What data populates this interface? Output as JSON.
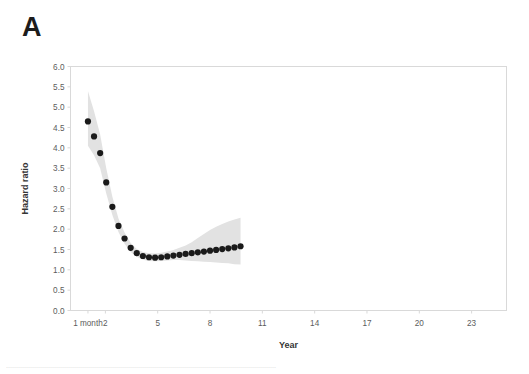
{
  "figure": {
    "panel_label": "A",
    "background_color": "#ffffff"
  },
  "axes": {
    "y_title": "Hazard ratio",
    "x_title": "Year",
    "y_ticks": [
      "0.0",
      "0.5",
      "1.0",
      "1.5",
      "2.0",
      "2.5",
      "3.0",
      "3.5",
      "4.0",
      "4.5",
      "5.0",
      "5.5",
      "6.0"
    ],
    "x_ticks": [
      "1 month",
      "2",
      "5",
      "8",
      "11",
      "14",
      "17",
      "20",
      "23"
    ],
    "frame_color": "#d9d9d9",
    "tick_label_color": "#5c5c5c",
    "axis_title_color": "#353535"
  },
  "caption": {
    "text": "......................................................................................................................................."
  },
  "chart_data": {
    "type": "scatter",
    "title": "",
    "subtitle": "",
    "xlabel": "Year",
    "ylabel": "Hazard ratio",
    "xlim": [
      0,
      25
    ],
    "ylim": [
      0,
      6
    ],
    "grid": false,
    "legend": "none",
    "marker_color": "#1a1a1a",
    "band_color": "#e2e2e2",
    "band_label": "95% confidence interval",
    "x_tick_values": [
      1,
      2,
      5,
      8,
      11,
      14,
      17,
      20,
      23
    ],
    "x_tick_labels": [
      "1 month",
      "2",
      "5",
      "8",
      "11",
      "14",
      "17",
      "20",
      "23"
    ],
    "y_tick_values": [
      0.0,
      0.5,
      1.0,
      1.5,
      2.0,
      2.5,
      3.0,
      3.5,
      4.0,
      4.5,
      5.0,
      5.5,
      6.0
    ],
    "series": [
      {
        "name": "Hazard ratio",
        "x": [
          1.0,
          1.35,
          1.7,
          2.05,
          2.4,
          2.75,
          3.1,
          3.45,
          3.8,
          4.15,
          4.5,
          4.85,
          5.2,
          5.55,
          5.9,
          6.25,
          6.6,
          6.95,
          7.3,
          7.65,
          8.0,
          8.35,
          8.7,
          9.05,
          9.4,
          9.75
        ],
        "x_year_labels": [
          "1 month",
          "1",
          "2",
          "3",
          "4",
          "5",
          "6",
          "7",
          "8",
          "9",
          "10",
          "11",
          "12",
          "13",
          "14",
          "15",
          "16",
          "17",
          "18",
          "19",
          "20",
          "21",
          "22",
          "23",
          "24",
          "25"
        ],
        "values": [
          4.65,
          4.28,
          3.87,
          3.15,
          2.55,
          2.08,
          1.77,
          1.54,
          1.41,
          1.34,
          1.31,
          1.3,
          1.31,
          1.33,
          1.35,
          1.37,
          1.39,
          1.41,
          1.43,
          1.45,
          1.47,
          1.49,
          1.51,
          1.53,
          1.55,
          1.58
        ],
        "ci_lower": [
          4.05,
          3.82,
          3.5,
          2.88,
          2.35,
          1.93,
          1.64,
          1.44,
          1.32,
          1.25,
          1.22,
          1.21,
          1.22,
          1.23,
          1.24,
          1.24,
          1.23,
          1.22,
          1.21,
          1.2,
          1.19,
          1.18,
          1.17,
          1.16,
          1.14,
          1.13
        ],
        "ci_upper": [
          5.4,
          4.9,
          4.33,
          3.5,
          2.8,
          2.26,
          1.92,
          1.66,
          1.51,
          1.44,
          1.41,
          1.4,
          1.42,
          1.45,
          1.49,
          1.54,
          1.6,
          1.68,
          1.78,
          1.88,
          1.98,
          2.06,
          2.13,
          2.19,
          2.24,
          2.28
        ]
      }
    ]
  }
}
